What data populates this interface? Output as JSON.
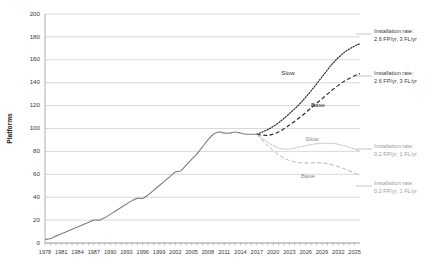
{
  "chart_data": {
    "type": "line",
    "title": "",
    "xlabel": "",
    "ylabel": "Platforms",
    "xlim": [
      1978,
      2036
    ],
    "ylim": [
      0,
      200
    ],
    "grid": true,
    "legend": "inline-annotations",
    "ytick_labels": [
      "200",
      "180",
      "160",
      "140",
      "120",
      "100",
      "80",
      "60",
      "40",
      "20",
      "0"
    ],
    "ytick_values": [
      200,
      180,
      160,
      140,
      120,
      100,
      80,
      60,
      40,
      20,
      0
    ],
    "xtick_labels": [
      "1978",
      "1981",
      "1984",
      "1987",
      "1990",
      "1993",
      "1996",
      "1999",
      "2002",
      "2005",
      "2008",
      "2011",
      "2014",
      "2017",
      "2020",
      "2023",
      "2026",
      "2029",
      "2032",
      "2035"
    ],
    "xtick_values": [
      1978,
      1981,
      1984,
      1987,
      1990,
      1993,
      1996,
      1999,
      2002,
      2005,
      2008,
      2011,
      2014,
      2017,
      2020,
      2023,
      2026,
      2029,
      2032,
      2035
    ],
    "series": [
      {
        "name": "Historical",
        "style": "solid",
        "color": "#7a7f86",
        "x": [
          1978,
          1979,
          1980,
          1981,
          1982,
          1983,
          1984,
          1985,
          1986,
          1987,
          1988,
          1989,
          1990,
          1991,
          1992,
          1993,
          1994,
          1995,
          1996,
          1997,
          1998,
          1999,
          2000,
          2001,
          2002,
          2003,
          2004,
          2005,
          2006,
          2007,
          2008,
          2009,
          2010,
          2011,
          2012,
          2013,
          2014,
          2015,
          2016,
          2017
        ],
        "values": [
          3,
          4,
          6,
          8,
          10,
          12,
          14,
          16,
          18,
          20,
          20,
          22,
          25,
          28,
          31,
          34,
          37,
          39,
          39,
          42,
          46,
          50,
          54,
          58,
          62,
          63,
          68,
          73,
          78,
          84,
          90,
          95,
          97,
          96,
          96,
          97,
          96,
          95,
          95,
          95
        ]
      },
      {
        "name": "Slow",
        "style": "dotted",
        "color": "#2c2c2c",
        "group": "upper",
        "installation_rate": "2.6 FP/yr, 3 FL/yr",
        "x": [
          2017,
          2019,
          2021,
          2023,
          2025,
          2027,
          2029,
          2031,
          2033,
          2035,
          2036
        ],
        "values": [
          95,
          99,
          105,
          113,
          122,
          133,
          145,
          157,
          166,
          172,
          174
        ]
      },
      {
        "name": "Base",
        "style": "dashed",
        "color": "#2c2c2c",
        "group": "upper",
        "installation_rate": "2.6 FP/yr, 3 FL/yr",
        "x": [
          2017,
          2019,
          2021,
          2023,
          2025,
          2027,
          2029,
          2031,
          2033,
          2035,
          2036
        ],
        "values": [
          95,
          94,
          97,
          103,
          110,
          118,
          126,
          134,
          141,
          146,
          148
        ]
      },
      {
        "name": "Slow",
        "style": "dotted",
        "color": "#b6b6b6",
        "group": "lower",
        "installation_rate": "0.2 FP/yr, 1 FL/yr",
        "x": [
          2017,
          2019,
          2021,
          2023,
          2025,
          2027,
          2029,
          2031,
          2033,
          2035,
          2036
        ],
        "values": [
          95,
          88,
          83,
          82,
          84,
          86,
          87,
          87,
          85,
          82,
          80
        ]
      },
      {
        "name": "Base",
        "style": "dashed",
        "color": "#b6b6b6",
        "group": "lower",
        "installation_rate": "0.2 FP/yr, 1 FL/yr",
        "x": [
          2017,
          2019,
          2021,
          2023,
          2025,
          2027,
          2029,
          2031,
          2033,
          2035,
          2036
        ],
        "values": [
          95,
          85,
          77,
          72,
          70,
          70,
          70,
          68,
          65,
          61,
          59
        ]
      }
    ],
    "annotations": [
      {
        "id": "slow-upper-label",
        "text": "Slow"
      },
      {
        "id": "base-upper-label",
        "text": "Base"
      },
      {
        "id": "slow-lower-label",
        "text": "Slow"
      },
      {
        "id": "base-lower-label",
        "text": "Base"
      },
      {
        "id": "anno-slow-upper-line1",
        "text": "Installation rate:"
      },
      {
        "id": "anno-slow-upper-line2",
        "text": "2.6 FP/yr, 3 FL/yr"
      },
      {
        "id": "anno-base-upper-line1",
        "text": "Installation rate:"
      },
      {
        "id": "anno-base-upper-line2",
        "text": "2.6 FP/yr, 3 FL/yr"
      },
      {
        "id": "anno-slow-lower-line1",
        "text": "Installation rate:"
      },
      {
        "id": "anno-slow-lower-line2",
        "text": "0.2 FP/yr, 1 FL/yr"
      },
      {
        "id": "anno-base-lower-line1",
        "text": "Installation rate:"
      },
      {
        "id": "anno-base-lower-line2",
        "text": "0.2 FP/yr, 1 FL/yr"
      }
    ]
  },
  "labels": {
    "y_axis_title": "Platforms",
    "slow_upper": "Slow",
    "base_upper": "Base",
    "slow_lower": "Slow",
    "base_lower": "Base",
    "anno_rate_title": "Installation rate:",
    "anno_rate_high": "2.6 FP/yr, 3 FL/yr",
    "anno_rate_low": "0.2 FP/yr, 1 FL/yr"
  },
  "caption": {
    "text": ""
  }
}
